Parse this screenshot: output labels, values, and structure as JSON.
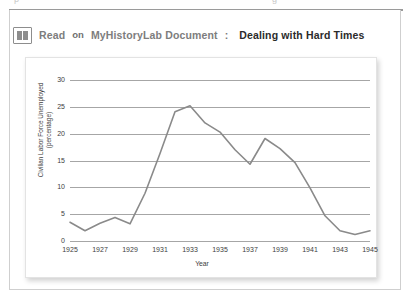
{
  "page": {
    "top_clipped_text_left": "p",
    "top_clipped_text_right": "g"
  },
  "header": {
    "icon": "book-icon",
    "read_label": "Read",
    "on_label": "on",
    "lab_label": "MyHistoryLab Document",
    "colon": ":",
    "document_title": "Dealing with Hard Times"
  },
  "chart_data": {
    "type": "line",
    "title": "",
    "xlabel": "Year",
    "ylabel": "Civilian Labor Force Unemployed\n(percentage)",
    "xlim": [
      1925,
      1945
    ],
    "ylim": [
      0,
      30
    ],
    "yticks": [
      0,
      5,
      10,
      15,
      20,
      25,
      30
    ],
    "xticks": [
      1925,
      1927,
      1929,
      1931,
      1933,
      1935,
      1937,
      1939,
      1941,
      1943,
      1945
    ],
    "grid": true,
    "legend": false,
    "line_color": "#8a8a8a",
    "x": [
      1925,
      1926,
      1927,
      1928,
      1929,
      1930,
      1931,
      1932,
      1933,
      1934,
      1935,
      1936,
      1937,
      1938,
      1939,
      1940,
      1941,
      1942,
      1943,
      1944,
      1945
    ],
    "values": [
      3.5,
      1.9,
      3.3,
      4.4,
      3.2,
      8.9,
      16.3,
      24.1,
      25.2,
      22.0,
      20.3,
      17.0,
      14.3,
      19.1,
      17.2,
      14.6,
      9.9,
      4.7,
      1.9,
      1.2,
      1.9
    ],
    "series": [
      {
        "name": "Civilian Labor Force Unemployed",
        "values": [
          3.5,
          1.9,
          3.3,
          4.4,
          3.2,
          8.9,
          16.3,
          24.1,
          25.2,
          22.0,
          20.3,
          17.0,
          14.3,
          19.1,
          17.2,
          14.6,
          9.9,
          4.7,
          1.9,
          1.2,
          1.9
        ]
      }
    ]
  }
}
